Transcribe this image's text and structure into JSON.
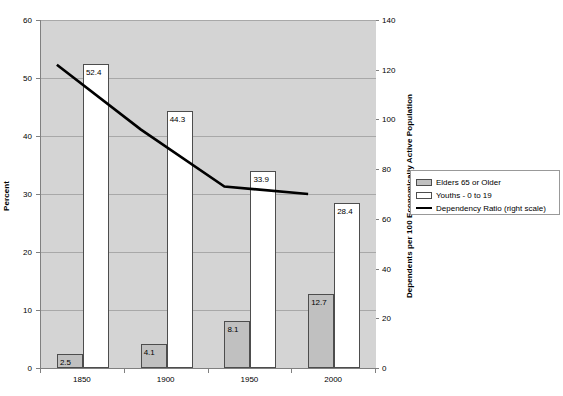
{
  "chart_data": {
    "type": "bar",
    "title": "",
    "categories": [
      "1850",
      "1900",
      "1950",
      "2000"
    ],
    "series": [
      {
        "name": "Elders 65 or Older",
        "axis": "left",
        "type": "bar",
        "color": "#c0c0c0",
        "values": [
          2.5,
          4.1,
          8.1,
          12.7
        ],
        "labels": [
          "2.5",
          "4.1",
          "8.1",
          "12.7"
        ]
      },
      {
        "name": "Youths - 0 to 19",
        "axis": "left",
        "type": "bar",
        "color": "#ffffff",
        "values": [
          52.4,
          44.3,
          33.9,
          28.4
        ],
        "labels": [
          "52.4",
          "44.3",
          "33.9",
          "28.4"
        ]
      },
      {
        "name": "Dependency Ratio (right scale)",
        "axis": "right",
        "type": "line",
        "color": "#000000",
        "values": [
          122,
          96,
          73,
          70
        ]
      }
    ],
    "xlabel": "",
    "ylabel": "Percent",
    "ylabel_right": "Dependents per 100 Economically Active Population",
    "ylim": [
      0,
      60
    ],
    "ylim_right": [
      0,
      140
    ],
    "yticks": [
      0,
      10,
      20,
      30,
      40,
      50,
      60
    ],
    "yticks_right": [
      0,
      20,
      40,
      60,
      80,
      100,
      120,
      140
    ],
    "ytick_labels": [
      "0",
      "10",
      "20",
      "30",
      "40",
      "50",
      "60"
    ],
    "ytick_labels_right": [
      "0",
      "20",
      "40",
      "60",
      "80",
      "100",
      "120",
      "140"
    ],
    "grid": true,
    "legend_position": "right",
    "plot_background": "#d4d4d4"
  },
  "axes": {
    "left_title": "Percent",
    "right_title": "Dependents per 100 Economically Active Population"
  },
  "legend": {
    "items": [
      {
        "label": "Elders 65 or Older",
        "kind": "swatch-gray"
      },
      {
        "label": "Youths - 0 to 19",
        "kind": "swatch-white"
      },
      {
        "label": "Dependency Ratio (right scale)",
        "kind": "line-black"
      }
    ]
  }
}
